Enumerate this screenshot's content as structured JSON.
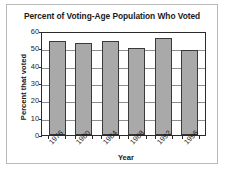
{
  "chart_data": {
    "type": "bar",
    "title": "Percent of Voting-Age Population Who Voted",
    "xlabel": "Year",
    "ylabel": "Percent that voted",
    "categories": [
      "1976",
      "1980",
      "1984",
      "1988",
      "1992",
      "1996"
    ],
    "values": [
      54,
      53,
      54,
      50,
      56,
      49
    ],
    "ylim": [
      0,
      60
    ],
    "yticks": [
      0,
      10,
      20,
      30,
      40,
      50,
      60
    ],
    "ytick_labels": [
      "0",
      "10",
      "20",
      "30",
      "40",
      "50",
      "60"
    ],
    "grid": true,
    "legend": false,
    "bar_color": "#a9a9a9",
    "bar_border_color": "#3a3a3a",
    "axis_color": "#2b2b2b",
    "grid_color": "#8e8e8e",
    "frame_color": "#b9b9b9",
    "background": "#ffffff"
  }
}
